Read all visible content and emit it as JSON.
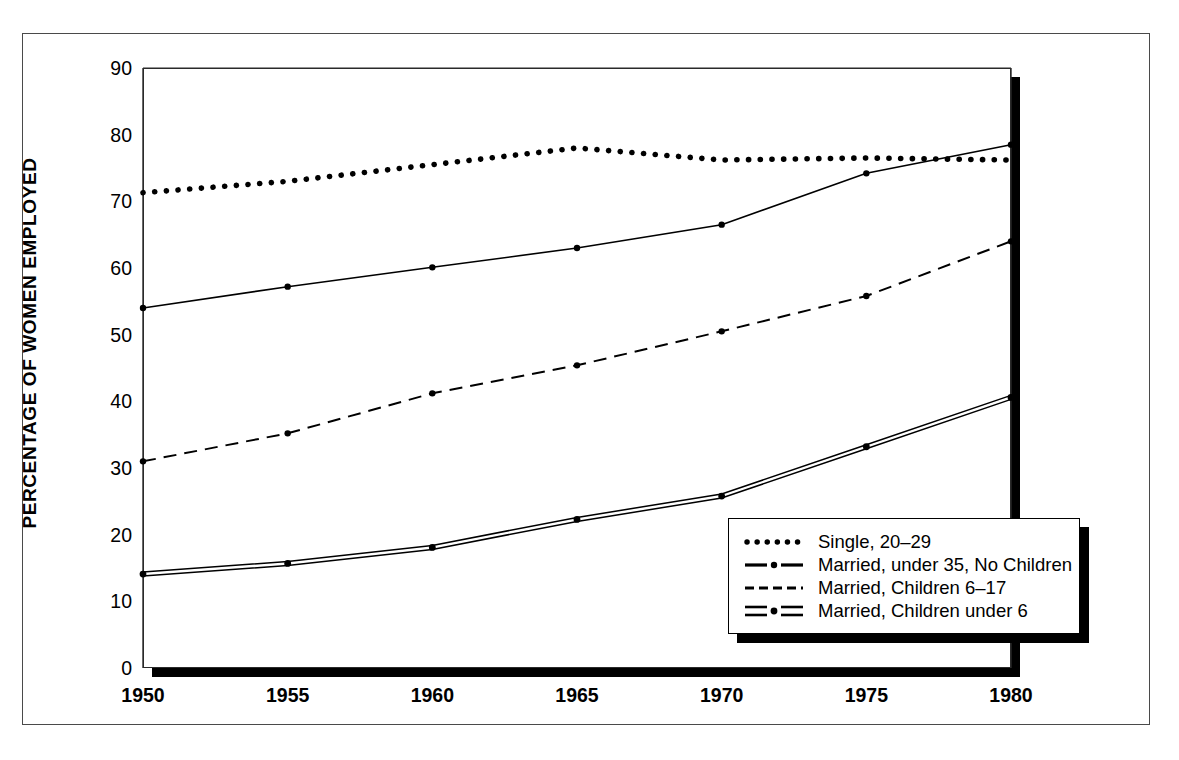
{
  "chart_data": {
    "type": "line",
    "title": "",
    "xlabel": "",
    "ylabel": "PERCENTAGE OF WOMEN EMPLOYED",
    "x": [
      1950,
      1955,
      1960,
      1965,
      1970,
      1975,
      1980
    ],
    "xtick_labels": [
      "1950",
      "1955",
      "1960",
      "1965",
      "1970",
      "1975",
      "1980"
    ],
    "ytick_labels": [
      "0",
      "10",
      "20",
      "30",
      "40",
      "50",
      "60",
      "70",
      "80",
      "90"
    ],
    "ytick_values": [
      0,
      10,
      20,
      30,
      40,
      50,
      60,
      70,
      80,
      90
    ],
    "yminor_values": [
      5,
      15,
      25,
      35,
      45,
      55,
      65,
      75,
      85
    ],
    "xlim": [
      1950,
      1980
    ],
    "ylim": [
      0,
      90
    ],
    "grid": true,
    "legend_position": "bottom-right",
    "series": [
      {
        "name": "Single, 20–29",
        "style": "dotted",
        "x": [
          1950,
          1955,
          1960,
          1965,
          1970,
          1975,
          1980
        ],
        "values": [
          71.3,
          73.0,
          75.5,
          78.0,
          76.2,
          76.5,
          76.2
        ]
      },
      {
        "name": "Married, under 35, No Children",
        "style": "dash-dot",
        "x": [
          1950,
          1955,
          1960,
          1965,
          1970,
          1975,
          1980
        ],
        "values": [
          54.0,
          57.2,
          60.1,
          63.0,
          66.5,
          74.2,
          78.5
        ]
      },
      {
        "name": "Married, Children 6–17",
        "style": "dashed",
        "x": [
          1950,
          1955,
          1960,
          1965,
          1970,
          1975,
          1980
        ],
        "values": [
          31.0,
          35.2,
          41.2,
          45.4,
          50.5,
          55.8,
          64.0
        ]
      },
      {
        "name": "Married, Children under 6",
        "style": "double-dash-dot",
        "x": [
          1950,
          1955,
          1960,
          1965,
          1970,
          1975,
          1980
        ],
        "values": [
          14.0,
          15.6,
          18.0,
          22.2,
          25.7,
          33.1,
          40.5
        ]
      }
    ]
  },
  "legend": {
    "items": [
      {
        "label": "Single, 20–29",
        "key": "dotted"
      },
      {
        "label": "Married, under 35, No Children",
        "key": "dash-dot"
      },
      {
        "label": "Married, Children 6–17",
        "key": "dashed"
      },
      {
        "label": "Married, Children under 6",
        "key": "double-dash-dot"
      }
    ]
  },
  "colors": {
    "line": "#000000",
    "grid": "#2a2a2a",
    "shadow": "#000000",
    "background": "#ffffff",
    "frame": "#4a4a4a"
  }
}
